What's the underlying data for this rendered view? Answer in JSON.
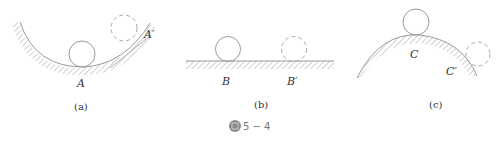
{
  "figure": {
    "number": "5 − 4",
    "icon": "figure-icon",
    "panels": [
      {
        "id": "a",
        "caption": "(a)",
        "surface": "concave-bowl",
        "labels": [
          "A",
          "A′"
        ]
      },
      {
        "id": "b",
        "caption": "(b)",
        "surface": "flat-ground",
        "labels": [
          "B",
          "B′"
        ]
      },
      {
        "id": "c",
        "caption": "(c)",
        "surface": "convex-dome",
        "labels": [
          "C",
          "C′"
        ]
      }
    ]
  },
  "colors": {
    "line": "#9a9a9a",
    "hatch": "#b0b0b0",
    "text": "#333333",
    "icon_bg": "#8a8a8a"
  }
}
